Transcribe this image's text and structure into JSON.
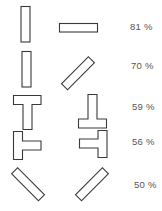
{
  "figure": {
    "rows": [
      {
        "left_shape": "vertical-bar",
        "right_shape": "horizontal-bar",
        "percent": "81 %"
      },
      {
        "left_shape": "vertical-bar",
        "right_shape": "diagonal-bar-right-tilt",
        "percent": "70 %"
      },
      {
        "left_shape": "t-shape",
        "right_shape": "inverted-t-shape",
        "percent": "59 %"
      },
      {
        "left_shape": "t-shape-rotated-right",
        "right_shape": "t-shape-rotated-left",
        "percent": "56 %"
      },
      {
        "left_shape": "diagonal-bar-left-tilt",
        "right_shape": "diagonal-bar-right-tilt",
        "percent": "50 %"
      }
    ]
  },
  "colors": {
    "stroke": "#3a3a3a",
    "text": "#555555",
    "background": "#ffffff"
  }
}
